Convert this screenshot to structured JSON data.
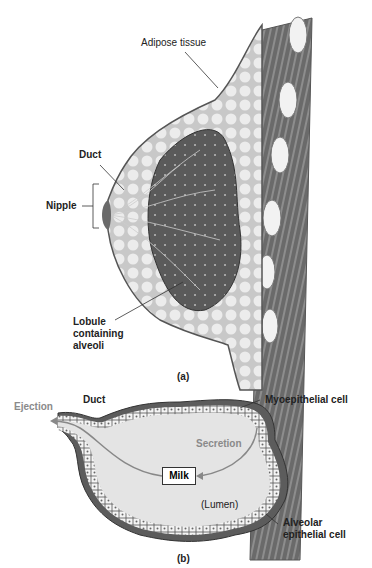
{
  "panel_a": {
    "caption": "(a)",
    "labels": {
      "adipose": "Adipose tissue",
      "duct": "Duct",
      "nipple": "Nipple",
      "lobule_line1": "Lobule",
      "lobule_line2": "containing",
      "lobule_line3": "alveoli"
    }
  },
  "panel_b": {
    "caption": "(b)",
    "labels": {
      "duct": "Duct",
      "ejection": "Ejection",
      "myoepithelial": "Myoepithelial cell",
      "secretion": "Secretion",
      "milk": "Milk",
      "lumen": "(Lumen)",
      "alveolar_line1": "Alveolar",
      "alveolar_line2": "epithelial cell"
    }
  },
  "colors": {
    "background": "#ffffff",
    "tissue_dark": "#555555",
    "adipose": "#d8d8d8",
    "lumen": "#e4e4e4",
    "process_label": "#8a8a8a"
  }
}
